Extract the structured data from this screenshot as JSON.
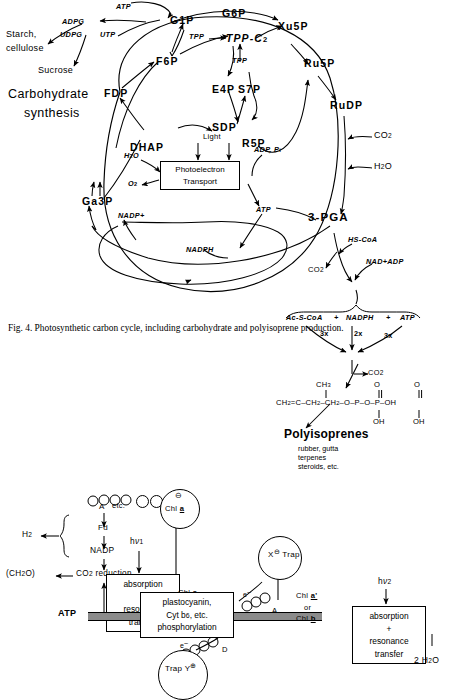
{
  "figure": {
    "caption": "Fig. 4. Photosynthetic carbon cycle, including carbohydrate and polyisoprene production.",
    "section_title_line1": "Carbohydrate",
    "section_title_line2": "synthesis"
  },
  "calvin_cycle": {
    "metabolites": [
      {
        "id": "g1p",
        "label": "G1P"
      },
      {
        "id": "g6p",
        "label": "G6P"
      },
      {
        "id": "f6p",
        "label": "F6P"
      },
      {
        "id": "e4p",
        "label": "E4P"
      },
      {
        "id": "s7p",
        "label": "S7P"
      },
      {
        "id": "sdp",
        "label": "SDP"
      },
      {
        "id": "r5p",
        "label": "R5P"
      },
      {
        "id": "xu5p",
        "label": "Xu5P"
      },
      {
        "id": "ru5p",
        "label": "Ru5P"
      },
      {
        "id": "rudp",
        "label": "RuDP"
      },
      {
        "id": "fdp",
        "label": "FDP"
      },
      {
        "id": "dhap",
        "label": "DHAP"
      },
      {
        "id": "ga3p",
        "label": "Ga3P"
      },
      {
        "id": "tppc2",
        "label": "TPP-C"
      },
      {
        "id": "pga",
        "label": "3-PGA"
      }
    ],
    "products": {
      "starch_line1": "Starch,",
      "starch_line2": "cellulose",
      "sucrose": "Sucrose"
    },
    "cofactors": [
      {
        "id": "atp_top",
        "label": "ATP"
      },
      {
        "id": "adpg",
        "label": "ADPG"
      },
      {
        "id": "udpg",
        "label": "UDPG"
      },
      {
        "id": "utp",
        "label": "UTP"
      },
      {
        "id": "tpp1",
        "label": "TPP"
      },
      {
        "id": "tpp2",
        "label": "TPP"
      },
      {
        "id": "adp_pi",
        "label": "ADP, P"
      },
      {
        "id": "atp_mid",
        "label": "ATP"
      },
      {
        "id": "nadp_plus",
        "label": "NADP"
      },
      {
        "id": "nadph",
        "label": "NADPH"
      }
    ],
    "inputs": [
      {
        "id": "co2_rudp",
        "label": "CO"
      },
      {
        "id": "h2o_rudp",
        "label": "H"
      },
      {
        "id": "h2o_box",
        "label": "H"
      },
      {
        "id": "o2_box",
        "label": "O"
      }
    ],
    "light_box": {
      "light_label": "Light",
      "line1": "Photoelectron",
      "line2": "Transport"
    }
  },
  "isoprenoid_pathway": {
    "hs_coa": "HS-CoA",
    "co2_first": "CO",
    "nad_adp": "NAD+ADP",
    "precursors": {
      "ac_s_coa": "Ac-S-CoA",
      "plus1": "+",
      "nadph": "NADPH",
      "plus2": "+",
      "atp": "ATP"
    },
    "stoichiometry": [
      "3x",
      "2x",
      "3x"
    ],
    "co2_second": "CO",
    "structure": {
      "methyl": "CH",
      "backbone": "CH =C-CH -CH -O-P-O-P-OH",
      "oh_labels": [
        "OH",
        "OH"
      ],
      "double_bond_o": [
        "O",
        "O"
      ]
    },
    "product_title": "Polyisoprenes",
    "product_examples_line1": "rubber, gutta",
    "product_examples_line2": "terpenes",
    "product_examples_line3": "steroids, etc."
  },
  "z_scheme": {
    "acceptor_a_left": "A",
    "etc_label": "etc.",
    "pigment_circles": [
      "γ",
      "β",
      "α"
    ],
    "chl_a_trap": {
      "charge": "⊖",
      "label": "Chl",
      "species": "a"
    },
    "ferredoxin": "Fd",
    "nadp": "NADP",
    "hydrogen": "H",
    "co2_reduction": "CO  reduction",
    "carbohydrate": "(CH O)",
    "photon1": "hν",
    "photon1_sub": "1",
    "photon2": "hν",
    "photon2_sub": "2",
    "psi_box_line1": "absorption",
    "psi_box_line2": "+",
    "psi_box_line3": "resonance",
    "psi_box_line4": "transfer",
    "psii_box_line1": "absorption",
    "psii_box_line2": "+",
    "psii_box_line3": "resonance",
    "psii_box_line4": "transfer",
    "chl_a_antenna": "Chl",
    "chl_a_antenna_species": "a",
    "atp_output": "ATP",
    "electron_transport_box": {
      "line1": "plastocyanin,",
      "line2": "Cyt b  , etc.",
      "line2_sub": "6",
      "line3": "phosphorylation"
    },
    "trap_x": {
      "label": "X",
      "charge": "⊖",
      "name": "Trap"
    },
    "acceptor_a_right": "A",
    "electron_label_left": "e",
    "electron_label_right": "e",
    "donor_d": "D",
    "trap_y": {
      "name": "Trap Y",
      "charge": "⊕"
    },
    "chl_a_prime": "Chl",
    "chl_a_prime_species": "a'",
    "or_label": "or",
    "chl_b": "Chl",
    "chl_b_species": "b",
    "water": "2 H O"
  },
  "colors": {
    "ink": "#000000",
    "band": "#8b8b8b",
    "paper": "#ffffff"
  }
}
